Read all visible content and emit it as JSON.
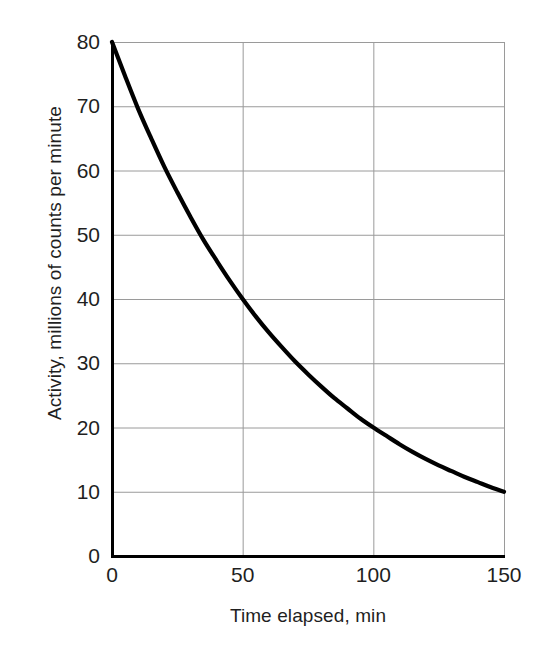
{
  "chart_data": {
    "type": "line",
    "title": "",
    "subtitle": "",
    "xlabel": "Time elapsed, min",
    "ylabel": "Activity, millions of counts per minute",
    "xlim": [
      0,
      150
    ],
    "ylim": [
      0,
      80
    ],
    "xticks": [
      0,
      50,
      100,
      150
    ],
    "xtick_labels": [
      "0",
      "50",
      "100",
      "150"
    ],
    "yticks": [
      0,
      10,
      20,
      30,
      40,
      50,
      60,
      70,
      80
    ],
    "ytick_labels": [
      "0",
      "10",
      "20",
      "30",
      "40",
      "50",
      "60",
      "70",
      "80"
    ],
    "grid": true,
    "grid_axes": "both",
    "grid_color": "#9a9a9a",
    "legend": null,
    "legend_position": "none",
    "annotations": [],
    "series": [
      {
        "name": "Radioactive decay",
        "color": "#000000",
        "line_width": 4,
        "marker": "none",
        "description": "Exponential decay, half-life 50 min, initial activity 80",
        "half_life": 50,
        "initial_value": 80,
        "x": [
          0,
          5,
          10,
          15,
          20,
          25,
          30,
          35,
          40,
          45,
          50,
          55,
          60,
          65,
          70,
          75,
          80,
          85,
          90,
          95,
          100,
          105,
          110,
          115,
          120,
          125,
          130,
          135,
          140,
          145,
          150
        ],
        "values": [
          80.0,
          74.7,
          69.6,
          65.0,
          60.6,
          56.6,
          52.8,
          49.2,
          46.0,
          42.9,
          40.0,
          37.3,
          34.8,
          32.5,
          30.3,
          28.3,
          26.4,
          24.6,
          23.0,
          21.4,
          20.0,
          18.7,
          17.4,
          16.2,
          15.1,
          14.1,
          13.2,
          12.3,
          11.5,
          10.7,
          10.0
        ]
      }
    ],
    "key_points": [
      {
        "x": 0,
        "y": 80
      },
      {
        "x": 50,
        "y": 40
      },
      {
        "x": 100,
        "y": 20
      },
      {
        "x": 150,
        "y": 10
      }
    ]
  },
  "figure": {
    "background": "#ffffff",
    "axis_color": "#000000",
    "spines": [
      "left",
      "bottom"
    ]
  }
}
